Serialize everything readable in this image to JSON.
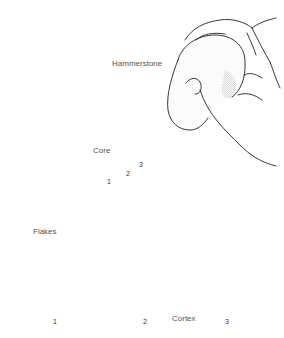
{
  "figure": {
    "labels": {
      "hammerstone": "Hammerstone",
      "core": "Core",
      "flakes": "Flakes",
      "cortex": "Cortex"
    },
    "core_scars": [
      "1",
      "2",
      "3"
    ],
    "flake_numbers": [
      "1",
      "2",
      "3"
    ]
  },
  "colors": {
    "line": "#222222",
    "stipple": "#555555",
    "background": "#ffffff"
  }
}
